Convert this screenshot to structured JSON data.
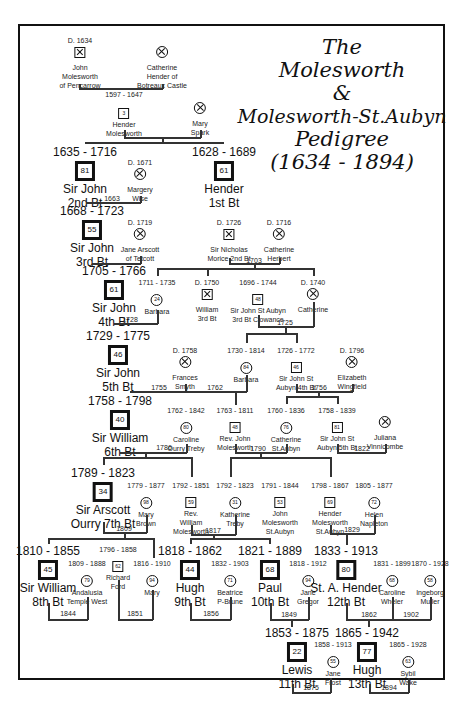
{
  "title": {
    "line1": "The",
    "line2": "Molesworth",
    "line3": "&",
    "line4": "Molesworth-St.Aubyn",
    "line5": "Pedigree",
    "line6": "(1634 - 1894)"
  },
  "people": {
    "john_pencarrow": {
      "dates": "D. 1634",
      "name1": "John",
      "name2": "Molesworth",
      "name3": "of Pencarrow"
    },
    "catherine_hender": {
      "dates": "",
      "name1": "Catherine",
      "name2": "Hender of",
      "name3": "Botreaux Castle"
    },
    "hender_molesworth": {
      "dates": "",
      "name1": "Hender",
      "name2": "Molesworth",
      "age": "3"
    },
    "mary_spark": {
      "dates": "",
      "name1": "Mary",
      "name2": "Spark"
    },
    "sir_john_2": {
      "dates": "1635 - 1716",
      "name1": "Sir John",
      "name2": "2nd Bt",
      "age": "81"
    },
    "margery_wise": {
      "dates": "D. 1671",
      "name1": "Margery",
      "name2": "Wise"
    },
    "hender_1st": {
      "dates": "1628 - 1689",
      "name1": "Hender",
      "name2": "1st Bt",
      "age": "61"
    },
    "sir_john_3": {
      "dates": "1668 - 1723",
      "name1": "Sir John",
      "name2": "3rd Bt",
      "age": "55"
    },
    "jane_arscott": {
      "dates": "D. 1719",
      "name1": "Jane Arscott",
      "name2": "of Tetcott"
    },
    "sir_nicholas_morice": {
      "dates": "D. 1726",
      "name1": "Sir Nicholas",
      "name2": "Morice 2nd Bt"
    },
    "catherine_herbert": {
      "dates": "D. 1716",
      "name1": "Catherine",
      "name2": "Herbert"
    },
    "sir_john_4": {
      "dates": "1705 - 1766",
      "name1": "Sir John",
      "name2": "4th Bt",
      "age": "61"
    },
    "barbara_1": {
      "dates": "1711 - 1735",
      "name1": "Barbara",
      "age": "24"
    },
    "william_3rd": {
      "dates": "D. 1750",
      "name1": "William",
      "name2": "3rd Bt"
    },
    "sir_john_st_aubyn_3": {
      "dates": "1696 - 1744",
      "name1": "Sir John St Aubyn",
      "name2": "3rd Bt Clowance",
      "age": "48"
    },
    "catherine_1740": {
      "dates": "D. 1740",
      "name1": "Catherine"
    },
    "sir_john_5": {
      "dates": "1729 - 1775",
      "name1": "Sir John",
      "name2": "5th Bt",
      "age": "46"
    },
    "frances_smyth": {
      "dates": "D. 1758",
      "name1": "Frances",
      "name2": "Smyth"
    },
    "barbara_2": {
      "dates": "1730 - 1814",
      "name1": "Barbara",
      "age": "84"
    },
    "sir_john_st_aubyn_4": {
      "dates": "1726 - 1772",
      "name1": "Sir John St",
      "name2": "Aubyn 4th Bt",
      "age": "46"
    },
    "elizabeth_wingfield": {
      "dates": "D. 1796",
      "name1": "Elizabeth",
      "name2": "Wingfield"
    },
    "sir_william_6": {
      "dates": "1758 - 1798",
      "name1": "Sir William",
      "name2": "6th Bt",
      "age": "40"
    },
    "caroline_treby": {
      "dates": "1762 - 1842",
      "name1": "Caroline",
      "name2": "Ourry Treby",
      "age": "80"
    },
    "rev_john": {
      "dates": "1763 - 1811",
      "name1": "Rev. John",
      "name2": "Molesworth",
      "age": "48"
    },
    "catherine_st_aubyn": {
      "dates": "1760 - 1836",
      "name1": "Catherine",
      "name2": "St.Aubyn",
      "age": "76"
    },
    "sir_john_st_aubyn_5": {
      "dates": "1758 - 1839",
      "name1": "Sir John St",
      "name2": "Aubyn 5th Bt",
      "age": "81"
    },
    "juliana_vinnicombe": {
      "dates": "",
      "name1": "Juliana",
      "name2": "Vinnicombe"
    },
    "sir_arscott_7": {
      "dates": "1789 - 1823",
      "name1": "Sir Arscott",
      "name2": "Ourry  7th Bt",
      "age": "34"
    },
    "mary_brown": {
      "dates": "1779 - 1877",
      "name1": "Mary",
      "name2": "Brown",
      "age": "98"
    },
    "rev_william": {
      "dates": "1792 - 1851",
      "name1": "Rev.",
      "name2": "William",
      "name3": "Molesworth",
      "age": "59"
    },
    "katherine_treby": {
      "dates": "1792 - 1823",
      "name1": "Katherine",
      "name2": "Treby",
      "age": "31"
    },
    "john_ms_aubyn": {
      "dates": "1791 - 1844",
      "name1": "John",
      "name2": "Molesworth",
      "name3": "St.Aubyn",
      "age": "53"
    },
    "hender_ms_aubyn": {
      "dates": "1798 - 1867",
      "name1": "Hender",
      "name2": "Molesworth",
      "name3": "St.Aubyn",
      "age": "69"
    },
    "helen_napleton": {
      "dates": "1805 - 1877",
      "name1": "Helen",
      "name2": "Napleton",
      "age": "72"
    },
    "sir_william_8": {
      "dates": "1810 - 1855",
      "name1": "Sir William",
      "name2": "8th Bt",
      "age": "45"
    },
    "andalusia_west": {
      "dates": "1809 - 1888",
      "name1": "Andalusia",
      "name2": "Temple West",
      "age": "79"
    },
    "richard_ford": {
      "dates": "1796 - 1858",
      "name1": "Richard",
      "name2": "Ford",
      "age": "62"
    },
    "mary_1816": {
      "dates": "1816 - 1910",
      "name1": "Mary",
      "age": "94"
    },
    "hugh_9": {
      "dates": "1818 - 1862",
      "name1": "Hugh",
      "name2": "9th Bt",
      "age": "44"
    },
    "beatrice_brune": {
      "dates": "1832 - 1903",
      "name1": "Beatrice",
      "name2": "P-Brune",
      "age": "71"
    },
    "paul_10": {
      "dates": "1821 - 1889",
      "name1": "Paul",
      "name2": "10th Bt",
      "age": "68"
    },
    "jane_gregor": {
      "dates": "1818 - 1912",
      "name1": "Jane",
      "name2": "Gregor",
      "age": "94"
    },
    "st_a_hender_12": {
      "dates": "1833 - 1913",
      "name1": "St. A. Hender",
      "name2": "12th Bt",
      "age": "80"
    },
    "caroline_wheler": {
      "dates": "1831 - 1899",
      "name1": "Caroline",
      "name2": "Wheler",
      "age": "68"
    },
    "ingeborg_muller": {
      "dates": "1870 - 1928",
      "name1": "Ingeborg",
      "name2": "Muller",
      "age": "58"
    },
    "lewis_11": {
      "dates": "1853 - 1875",
      "name1": "Lewis",
      "name2": "11th Bt",
      "age": "22"
    },
    "jane_frost": {
      "dates": "1858 - 1913",
      "name1": "Jane",
      "name2": "Frost",
      "age": "55"
    },
    "hugh_13": {
      "dates": "1865 - 1942",
      "name1": "Hugh",
      "name2": "13th Bt",
      "age": "77"
    },
    "sybil_wake": {
      "dates": "1865 - 1928",
      "name1": "Sybil",
      "name2": "Wake",
      "age": "63"
    }
  },
  "marriages": {
    "m1": "1597 - 1647",
    "m2": "1663",
    "m3": "1703",
    "m4": "1728",
    "m5": "1725",
    "m6": "1755",
    "m7": "1762",
    "m8": "1756",
    "m9": "1786",
    "m10": "1790",
    "m11": "1822",
    "m12": "1809",
    "m13": "1817",
    "m14": "1829",
    "m15": "1844",
    "m16": "1851",
    "m17": "1856",
    "m18": "1849",
    "m19": "1862",
    "m20": "1902",
    "m21": "1875",
    "m22": "1894"
  },
  "legend": {
    "baronet_symbol": "bold-square-icon",
    "male_symbol": "square-icon",
    "female_symbol": "circle-icon",
    "deceased_mark": "cross-mark-icon"
  }
}
